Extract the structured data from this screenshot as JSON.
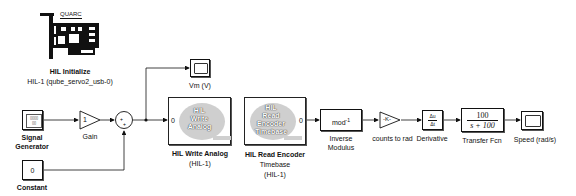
{
  "diagram": {
    "blocks": {
      "hil_initialize": {
        "brand": "QUARC",
        "title": "HIL Initialize",
        "subtitle": "HIL-1 (qube_servo2_usb-0)"
      },
      "signal_generator": {
        "label_line1": "Signal",
        "label_line2": "Generator",
        "icon_text": "0000\n0 0"
      },
      "gain": {
        "value": "1",
        "label": "Gain"
      },
      "sum": {
        "signs": "+ +"
      },
      "constant": {
        "value": "0",
        "label": "Constant"
      },
      "vm_scope": {
        "label": "Vm (V)"
      },
      "hil_write_analog": {
        "icon_line1": "HIL",
        "icon_line2": "Write",
        "icon_line3": "Analog",
        "port": "0",
        "label_line1": "HIL Write Analog",
        "label_line2": "(HIL-1)"
      },
      "hil_read_encoder": {
        "icon_line1": "HIL",
        "icon_line2": "Read",
        "icon_line3": "Encoder",
        "icon_line4": "Timebase",
        "port": "0",
        "label_line1": "HIL Read Encoder",
        "label_line2": "Timebase",
        "label_line3": "(HIL-1)"
      },
      "inverse_modulus": {
        "icon_text": "mod",
        "icon_sup": "-1",
        "label_line1": "Inverse",
        "label_line2": "Modulus"
      },
      "counts_to_rad": {
        "value": "-K-",
        "label": "counts to rad"
      },
      "derivative": {
        "num": "Δu",
        "den": "Δt",
        "label": "Derivative"
      },
      "transfer_fcn": {
        "num": "100",
        "den": "s + 100",
        "label": "Transfer Fcn"
      },
      "speed_scope": {
        "label": "Speed (rad/s)"
      }
    },
    "colors": {
      "line": "#111111",
      "hil_icon_bg": "#cfcfcf"
    }
  }
}
